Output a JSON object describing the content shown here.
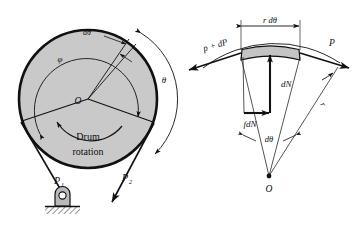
{
  "figure": {
    "colors": {
      "drum_fill": "#c9c9c9",
      "element_fill": "#c4c4c4",
      "line": "#111111",
      "thin_line": "#2a2a2a",
      "background": "#ffffff"
    }
  },
  "left_diagram": {
    "name": "drum-and-belt-diagram",
    "labels": {
      "center": "O",
      "d_theta": "dθ",
      "phi": "φ",
      "theta": "θ",
      "rotation_line1": "Drum",
      "rotation_line2": "rotation",
      "tension_1": "P",
      "tension_1_sub": "1",
      "tension_2": "P",
      "tension_2_sub": "2"
    }
  },
  "right_diagram": {
    "name": "belt-element-free-body-diagram",
    "labels": {
      "center": "O",
      "arc_length": "r dθ",
      "tension_left": "p + dP",
      "tension_right": "P",
      "normal_force": "dN",
      "friction_force": "fdN",
      "angle": "dθ",
      "radius": "r"
    }
  }
}
